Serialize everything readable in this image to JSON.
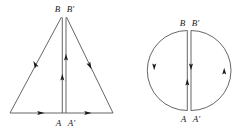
{
  "figure": {
    "title": "",
    "background_color": "#ffffff",
    "line_color": "#555555",
    "arrow_color": "#1a1a1a",
    "label_color": "#1a1a1a",
    "panels": [
      {
        "id": "triangle-panel",
        "shape": "triangle",
        "labels": {
          "top_left": "B",
          "top_right": "B'",
          "bottom_left": "A",
          "bottom_right": "A'"
        },
        "arrow_directions": {
          "base_left_segment": "right",
          "base_right_segment": "right",
          "left_slant": "up-right",
          "right_slant": "down-right",
          "inner_left_vertical": "up",
          "inner_right_vertical": "up"
        }
      },
      {
        "id": "circle-panel",
        "shape": "circle",
        "labels": {
          "top_left": "B",
          "top_right": "B'",
          "bottom_left": "A",
          "bottom_right": "A'"
        },
        "arrow_directions": {
          "left_arc": "down",
          "right_arc": "up",
          "inner_left_vertical": "up",
          "inner_right_vertical": "down"
        }
      }
    ]
  }
}
